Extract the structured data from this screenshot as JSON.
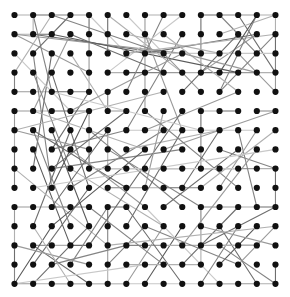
{
  "diagram": {
    "type": "network-graph",
    "layout": "grid",
    "grid": {
      "cols": 15,
      "rows": 15,
      "x0": 14.5,
      "y0": 15.0,
      "dx": 18.64,
      "dy": 19.2,
      "block_size": 5
    },
    "node_style": {
      "radius": 3.1,
      "color": "#111111"
    },
    "edge_colors": [
      "#c8c8c8",
      "#b0b0b0",
      "#9a9a9a",
      "#848484",
      "#6e6e6e",
      "#5a5a5a"
    ],
    "edge_width": 1.1,
    "grid_edges": [
      [
        0,
        0,
        1,
        0
      ],
      [
        1,
        0,
        2,
        0
      ],
      [
        2,
        0,
        3,
        0
      ],
      [
        3,
        0,
        4,
        0
      ],
      [
        1,
        0,
        1,
        1
      ],
      [
        4,
        0,
        4,
        1
      ],
      [
        4,
        1,
        4,
        2
      ],
      [
        4,
        2,
        4,
        3
      ],
      [
        4,
        3,
        4,
        4
      ],
      [
        5,
        0,
        5,
        1
      ],
      [
        5,
        1,
        5,
        2
      ],
      [
        8,
        0,
        9,
        0
      ],
      [
        7,
        0,
        8,
        0
      ],
      [
        10,
        0,
        11,
        0
      ],
      [
        11,
        0,
        12,
        0
      ],
      [
        12,
        0,
        13,
        0
      ],
      [
        13,
        0,
        14,
        0
      ],
      [
        10,
        0,
        10,
        1
      ],
      [
        10,
        1,
        10,
        2
      ],
      [
        10,
        2,
        10,
        3
      ],
      [
        14,
        0,
        14,
        1
      ],
      [
        14,
        1,
        14,
        2
      ],
      [
        14,
        2,
        14,
        3
      ],
      [
        14,
        3,
        14,
        4
      ],
      [
        0,
        1,
        1,
        1
      ],
      [
        1,
        1,
        2,
        1
      ],
      [
        0,
        3,
        0,
        4
      ],
      [
        0,
        4,
        1,
        4
      ],
      [
        1,
        4,
        2,
        4
      ],
      [
        2,
        4,
        3,
        4
      ],
      [
        3,
        4,
        4,
        4
      ],
      [
        0,
        5,
        0,
        6
      ],
      [
        0,
        6,
        0,
        7
      ],
      [
        0,
        7,
        0,
        8
      ],
      [
        0,
        8,
        0,
        9
      ],
      [
        0,
        5,
        1,
        5
      ],
      [
        1,
        5,
        2,
        5
      ],
      [
        2,
        5,
        3,
        5
      ],
      [
        3,
        5,
        4,
        5
      ],
      [
        4,
        5,
        4,
        6
      ],
      [
        4,
        6,
        4,
        7
      ],
      [
        4,
        7,
        4,
        8
      ],
      [
        5,
        4,
        5,
        5
      ],
      [
        5,
        5,
        6,
        5
      ],
      [
        5,
        3,
        6,
        3
      ],
      [
        6,
        3,
        7,
        3
      ],
      [
        7,
        3,
        8,
        3
      ],
      [
        8,
        3,
        9,
        3
      ],
      [
        9,
        3,
        10,
        3
      ],
      [
        10,
        3,
        11,
        3
      ],
      [
        11,
        3,
        12,
        3
      ],
      [
        12,
        3,
        13,
        3
      ],
      [
        13,
        3,
        14,
        3
      ],
      [
        10,
        5,
        10,
        6
      ],
      [
        10,
        6,
        10,
        7
      ],
      [
        10,
        7,
        10,
        8
      ],
      [
        10,
        5,
        11,
        5
      ],
      [
        11,
        5,
        12,
        5
      ],
      [
        13,
        5,
        14,
        5
      ],
      [
        5,
        8,
        6,
        8
      ],
      [
        6,
        8,
        7,
        8
      ],
      [
        7,
        8,
        8,
        8
      ],
      [
        8,
        8,
        9,
        8
      ],
      [
        5,
        6,
        5,
        7
      ],
      [
        5,
        7,
        5,
        8
      ],
      [
        10,
        8,
        11,
        8
      ],
      [
        11,
        8,
        12,
        8
      ],
      [
        12,
        8,
        13,
        8
      ],
      [
        13,
        8,
        14,
        8
      ],
      [
        14,
        8,
        14,
        9
      ],
      [
        14,
        9,
        14,
        10
      ],
      [
        0,
        10,
        1,
        10
      ],
      [
        1,
        10,
        2,
        10
      ],
      [
        2,
        10,
        3,
        10
      ],
      [
        3,
        10,
        4,
        10
      ],
      [
        0,
        10,
        0,
        11
      ],
      [
        0,
        11,
        0,
        12
      ],
      [
        0,
        12,
        0,
        13
      ],
      [
        0,
        13,
        0,
        14
      ],
      [
        0,
        14,
        1,
        14
      ],
      [
        1,
        14,
        2,
        14
      ],
      [
        2,
        14,
        3,
        14
      ],
      [
        3,
        14,
        4,
        14
      ],
      [
        4,
        14,
        5,
        14
      ],
      [
        5,
        14,
        6,
        14
      ],
      [
        5,
        10,
        5,
        11
      ],
      [
        5,
        11,
        5,
        12
      ],
      [
        5,
        12,
        5,
        13
      ],
      [
        5,
        13,
        5,
        14
      ],
      [
        5,
        10,
        6,
        10
      ],
      [
        10,
        10,
        11,
        10
      ],
      [
        11,
        10,
        12,
        10
      ],
      [
        12,
        10,
        13,
        10
      ],
      [
        13,
        10,
        14,
        10
      ],
      [
        10,
        10,
        10,
        11
      ],
      [
        10,
        11,
        10,
        12
      ],
      [
        10,
        12,
        10,
        13
      ],
      [
        10,
        14,
        11,
        14
      ],
      [
        11,
        14,
        12,
        14
      ],
      [
        12,
        14,
        13,
        14
      ],
      [
        13,
        14,
        14,
        14
      ],
      [
        14,
        13,
        14,
        14
      ],
      [
        5,
        9,
        6,
        9
      ],
      [
        6,
        9,
        7,
        9
      ],
      [
        7,
        9,
        8,
        9
      ],
      [
        8,
        9,
        9,
        9
      ],
      [
        9,
        9,
        10,
        9
      ],
      [
        1,
        12,
        2,
        12
      ],
      [
        2,
        12,
        3,
        12
      ],
      [
        3,
        12,
        4,
        12
      ],
      [
        6,
        12,
        7,
        12
      ],
      [
        7,
        12,
        8,
        12
      ],
      [
        11,
        12,
        12,
        12
      ],
      [
        12,
        12,
        13,
        12
      ]
    ],
    "long_edges": [
      [
        0,
        1,
        4,
        3,
        2
      ],
      [
        1,
        0,
        2,
        4,
        3
      ],
      [
        2,
        0,
        0,
        3,
        1
      ],
      [
        3,
        0,
        1,
        2,
        4
      ],
      [
        4,
        0,
        6,
        2,
        0
      ],
      [
        1,
        1,
        8,
        2,
        4
      ],
      [
        0,
        1,
        9,
        2,
        2
      ],
      [
        2,
        1,
        12,
        3,
        5
      ],
      [
        1,
        2,
        2,
        9,
        3
      ],
      [
        2,
        2,
        1,
        8,
        4
      ],
      [
        3,
        1,
        1,
        5,
        2
      ],
      [
        4,
        4,
        2,
        7,
        4
      ],
      [
        3,
        2,
        5,
        5,
        1
      ],
      [
        0,
        2,
        3,
        5,
        0
      ],
      [
        5,
        0,
        9,
        3,
        1
      ],
      [
        6,
        0,
        8,
        2,
        0
      ],
      [
        7,
        0,
        7,
        5,
        2
      ],
      [
        8,
        0,
        6,
        4,
        3
      ],
      [
        9,
        0,
        5,
        3,
        0
      ],
      [
        6,
        1,
        11,
        2,
        1
      ],
      [
        7,
        2,
        13,
        1,
        4
      ],
      [
        8,
        2,
        2,
        0,
        3
      ],
      [
        7,
        1,
        9,
        6,
        2
      ],
      [
        8,
        3,
        3,
        1,
        4
      ],
      [
        9,
        1,
        6,
        6,
        3
      ],
      [
        7,
        2,
        12,
        2,
        0
      ],
      [
        6,
        2,
        14,
        1,
        1
      ],
      [
        8,
        2,
        10,
        4,
        2
      ],
      [
        11,
        0,
        13,
        2,
        3
      ],
      [
        12,
        0,
        14,
        3,
        4
      ],
      [
        13,
        1,
        10,
        3,
        2
      ],
      [
        11,
        1,
        14,
        0,
        1
      ],
      [
        12,
        1,
        9,
        4,
        4
      ],
      [
        13,
        0,
        11,
        4,
        3
      ],
      [
        10,
        2,
        14,
        2,
        0
      ],
      [
        12,
        2,
        14,
        4,
        2
      ],
      [
        11,
        3,
        13,
        0,
        5
      ],
      [
        14,
        1,
        11,
        4,
        3
      ],
      [
        12,
        4,
        8,
        1,
        1
      ],
      [
        13,
        3,
        9,
        2,
        2
      ],
      [
        2,
        3,
        4,
        9,
        4
      ],
      [
        1,
        3,
        3,
        8,
        3
      ],
      [
        2,
        6,
        4,
        11,
        5
      ],
      [
        3,
        6,
        1,
        11,
        4
      ],
      [
        1,
        7,
        3,
        12,
        5
      ],
      [
        2,
        7,
        6,
        6,
        3
      ],
      [
        4,
        7,
        0,
        6,
        2
      ],
      [
        3,
        8,
        8,
        11,
        1
      ],
      [
        1,
        6,
        6,
        9,
        4
      ],
      [
        2,
        8,
        9,
        7,
        3
      ],
      [
        3,
        7,
        7,
        10,
        2
      ],
      [
        0,
        8,
        5,
        12,
        1
      ],
      [
        4,
        9,
        1,
        13,
        4
      ],
      [
        2,
        9,
        4,
        5,
        5
      ],
      [
        3,
        5,
        9,
        2,
        2
      ],
      [
        1,
        5,
        7,
        7,
        1
      ],
      [
        4,
        6,
        9,
        10,
        3
      ],
      [
        2,
        10,
        5,
        6,
        4
      ],
      [
        3,
        11,
        1,
        6,
        3
      ],
      [
        6,
        5,
        2,
        8,
        4
      ],
      [
        7,
        6,
        12,
        4,
        2
      ],
      [
        8,
        6,
        3,
        9,
        3
      ],
      [
        6,
        7,
        11,
        6,
        1
      ],
      [
        7,
        7,
        2,
        11,
        5
      ],
      [
        8,
        7,
        14,
        5,
        2
      ],
      [
        9,
        6,
        6,
        11,
        4
      ],
      [
        6,
        6,
        13,
        6,
        0
      ],
      [
        5,
        7,
        10,
        10,
        3
      ],
      [
        9,
        5,
        4,
        12,
        4
      ],
      [
        8,
        5,
        7,
        9,
        2
      ],
      [
        7,
        5,
        12,
        9,
        3
      ],
      [
        11,
        6,
        9,
        9,
        4
      ],
      [
        12,
        6,
        13,
        10,
        3
      ],
      [
        13,
        6,
        11,
        9,
        2
      ],
      [
        14,
        6,
        10,
        9,
        1
      ],
      [
        12,
        7,
        8,
        10,
        4
      ],
      [
        11,
        7,
        14,
        8,
        3
      ],
      [
        13,
        7,
        9,
        12,
        2
      ],
      [
        1,
        12,
        4,
        14,
        4
      ],
      [
        2,
        11,
        0,
        14,
        5
      ],
      [
        3,
        13,
        5,
        10,
        3
      ],
      [
        4,
        11,
        1,
        14,
        4
      ],
      [
        0,
        12,
        4,
        13,
        2
      ],
      [
        2,
        13,
        6,
        12,
        3
      ],
      [
        1,
        11,
        3,
        14,
        1
      ],
      [
        6,
        10,
        9,
        14,
        4
      ],
      [
        7,
        11,
        5,
        13,
        3
      ],
      [
        8,
        11,
        6,
        14,
        2
      ],
      [
        9,
        11,
        7,
        14,
        5
      ],
      [
        6,
        13,
        10,
        13,
        1
      ],
      [
        7,
        10,
        11,
        14,
        0
      ],
      [
        8,
        13,
        4,
        10,
        3
      ],
      [
        11,
        11,
        13,
        14,
        4
      ],
      [
        12,
        11,
        10,
        14,
        3
      ],
      [
        13,
        11,
        11,
        13,
        5
      ],
      [
        14,
        11,
        12,
        13,
        2
      ],
      [
        11,
        12,
        14,
        14,
        3
      ],
      [
        12,
        10,
        9,
        13,
        4
      ],
      [
        13,
        12,
        8,
        12,
        1
      ],
      [
        10,
        11,
        14,
        12,
        2
      ],
      [
        12,
        13,
        7,
        11,
        3
      ],
      [
        14,
        10,
        10,
        12,
        4
      ],
      [
        0,
        14,
        7,
        13,
        0
      ],
      [
        2,
        14,
        12,
        14,
        0
      ],
      [
        5,
        12,
        14,
        11,
        1
      ],
      [
        1,
        9,
        14,
        7,
        0
      ],
      [
        0,
        6,
        8,
        4,
        1
      ],
      [
        2,
        4,
        10,
        6,
        0
      ],
      [
        4,
        8,
        12,
        8,
        0
      ]
    ]
  }
}
